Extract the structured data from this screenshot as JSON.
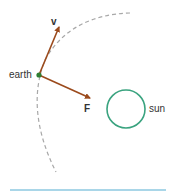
{
  "diagram": {
    "labels": {
      "earth": "earth",
      "sun": "sun",
      "velocity": "v",
      "force": "F"
    },
    "colors": {
      "orbit": "#a8a8a8",
      "vector": "#9b4a1c",
      "earth_dot": "#2e7d32",
      "sun_outline": "#3aa37f",
      "baseline": "#8cc8e0",
      "text": "#333333"
    }
  }
}
